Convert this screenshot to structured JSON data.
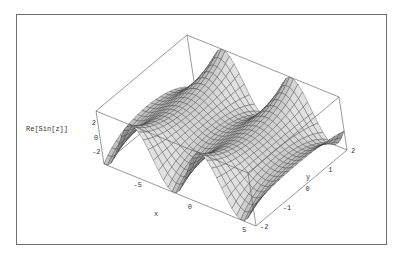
{
  "chart_data": {
    "type": "surface3d",
    "title": "",
    "function": "Re[Sin[z]]",
    "xlabel": "x",
    "ylabel": "y",
    "zlabel": "Re[Sin[z]]",
    "x_range": [
      -8,
      6
    ],
    "y_range": [
      -2,
      2
    ],
    "z_range": [
      -3.76,
      3.76
    ],
    "x_ticks": [
      "-5",
      "0",
      "5"
    ],
    "y_ticks": [
      "-2",
      "-1",
      "0",
      "1",
      "2"
    ],
    "z_ticks": [
      "2",
      "0",
      "-2"
    ],
    "mesh": true,
    "boxed": true,
    "shading": "gray"
  },
  "labels": {
    "zaxis": "Re[Sin[z]]",
    "xaxis": "x",
    "yaxis": "y"
  }
}
